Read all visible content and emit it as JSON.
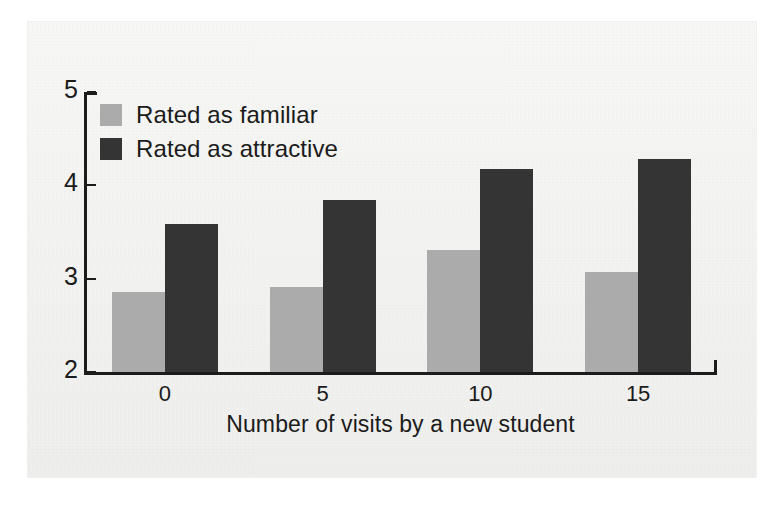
{
  "chart_data": {
    "type": "bar",
    "title": "",
    "subtitle": "",
    "xlabel": "Number of visits by a new student",
    "ylabel": "",
    "categories": [
      "0",
      "5",
      "10",
      "15"
    ],
    "x": [
      0,
      5,
      10,
      15
    ],
    "series": [
      {
        "name": "Rated as familiar",
        "color": "#ababab",
        "values": [
          2.86,
          2.91,
          3.31,
          3.07
        ]
      },
      {
        "name": "Rated as attractive",
        "color": "#343434",
        "values": [
          3.59,
          3.84,
          4.18,
          4.28
        ]
      }
    ],
    "ylim": [
      2,
      5
    ],
    "yticks": [
      2,
      3,
      4,
      5
    ],
    "ytick_labels": [
      "2",
      "3",
      "4",
      "5"
    ],
    "xtick_labels": [
      "0",
      "5",
      "10",
      "15"
    ],
    "grid": false,
    "legend_position": "upper left",
    "legend_entries": [
      "Rated as familiar",
      "Rated as attractive"
    ]
  },
  "axes": {
    "y_tick_labels": [
      "5",
      "4",
      "3",
      "2"
    ],
    "x_tick_labels": [
      "0",
      "5",
      "10",
      "15"
    ],
    "x_axis_title": "Number of visits by a new student"
  },
  "legend": {
    "items": [
      {
        "label": "Rated as familiar",
        "swatch": "#ababab"
      },
      {
        "label": "Rated as attractive",
        "swatch": "#343434"
      }
    ]
  },
  "colors": {
    "familiar": "#ababab",
    "attractive": "#343434",
    "axis": "#1c1c1c",
    "text": "#1b1b1b",
    "page": "#f4f4f2"
  }
}
